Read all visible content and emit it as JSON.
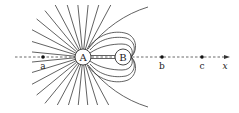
{
  "diagram": {
    "charges": [
      {
        "id": "A",
        "label": "A",
        "cx": 83,
        "cy": 57,
        "r": 8
      },
      {
        "id": "B",
        "label": "B",
        "cx": 123,
        "cy": 57,
        "r": 8
      }
    ],
    "points": [
      {
        "id": "a",
        "label": "a",
        "x": 43,
        "y": 57
      },
      {
        "id": "b",
        "label": "b",
        "x": 162,
        "y": 57
      },
      {
        "id": "c",
        "label": "c",
        "x": 202,
        "y": 57
      }
    ],
    "axis": {
      "label": "x",
      "x_start": 15,
      "x_end": 230,
      "y": 57
    },
    "colors": {
      "line": "#3a3a3a",
      "axis": "#444444",
      "dot": "#111111",
      "background": "#ffffff"
    }
  }
}
